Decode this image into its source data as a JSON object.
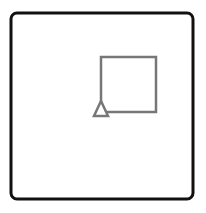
{
  "diagram": {
    "frame": {
      "x": 11,
      "y": 13,
      "width": 182,
      "height": 186,
      "radius": 6,
      "stroke": "#111111",
      "stroke_width": 3
    },
    "square": {
      "x": 101,
      "y": 57,
      "width": 55,
      "height": 55,
      "stroke": "#777777",
      "stroke_width": 2.5
    },
    "triangle": {
      "points": "101,101 94,116 108,116",
      "stroke": "#777777",
      "stroke_width": 2.5
    }
  }
}
